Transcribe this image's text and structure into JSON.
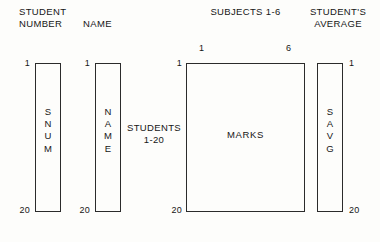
{
  "diagram": {
    "headers": [
      {
        "id": "student-number",
        "text": "STUDENT\nNUMBER"
      },
      {
        "id": "name",
        "text": "NAME"
      },
      {
        "id": "subjects",
        "text": "SUBJECTS 1-6"
      },
      {
        "id": "students-average",
        "text": "STUDENT'S\nAVERAGE"
      }
    ],
    "side_label": {
      "id": "students-range",
      "text": "STUDENTS\n1-20"
    },
    "column_indices": {
      "first": "1",
      "last": "6"
    },
    "arrays": [
      {
        "id": "snum",
        "caption": "SNUM",
        "letters": [
          "S",
          "N",
          "U",
          "M"
        ],
        "orientation": "vertical",
        "row_start": "1",
        "row_end": "20",
        "index_side": "left"
      },
      {
        "id": "name",
        "caption": "NAME",
        "letters": [
          "N",
          "A",
          "M",
          "E"
        ],
        "orientation": "vertical",
        "row_start": "1",
        "row_end": "20",
        "index_side": "left"
      },
      {
        "id": "marks",
        "caption": "MARKS",
        "letters": [],
        "orientation": "horizontal",
        "row_start": "1",
        "row_end": "20",
        "index_side": "left"
      },
      {
        "id": "savg",
        "caption": "SAVG",
        "letters": [
          "S",
          "A",
          "V",
          "G"
        ],
        "orientation": "vertical",
        "row_start": "1",
        "row_end": "20",
        "index_side": "right"
      }
    ],
    "colors": {
      "background": "#fdfdfb",
      "stroke": "#2b2b2b",
      "text": "#161616"
    }
  }
}
